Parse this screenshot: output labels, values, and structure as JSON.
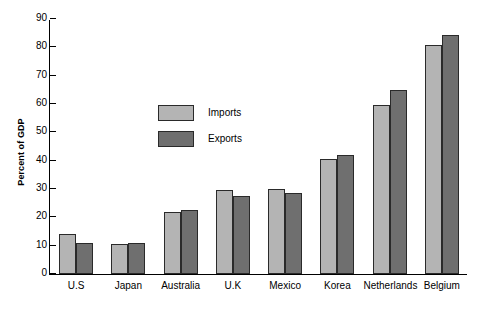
{
  "chart_data": {
    "type": "bar",
    "title": "",
    "subtitle": "",
    "xlabel": "",
    "ylabel": "Percent of GDP",
    "ylim": [
      0,
      90
    ],
    "yticks": [
      0,
      10,
      20,
      30,
      40,
      50,
      60,
      70,
      80,
      90
    ],
    "grid": false,
    "legend_position": "inside-upper-left",
    "categories": [
      "U.S",
      "Japan",
      "Australia",
      "U.K",
      "Mexico",
      "Korea",
      "Netherlands",
      "Belgium"
    ],
    "series": [
      {
        "name": "Imports",
        "color": "#b4b4b4",
        "values": [
          14,
          10.5,
          22,
          29.5,
          30,
          40.5,
          59.5,
          81
        ]
      },
      {
        "name": "Exports",
        "color": "#6f6f6f",
        "values": [
          11,
          11,
          22.5,
          27.5,
          28.5,
          42,
          65,
          84.5
        ]
      }
    ]
  },
  "axis": {
    "y_title": "Percent of GDP"
  },
  "legend": {
    "items": [
      {
        "label": "Imports",
        "color": "#b4b4b4"
      },
      {
        "label": "Exports",
        "color": "#6f6f6f"
      }
    ]
  },
  "style": {
    "background": "#ffffff",
    "axis_color": "#000000",
    "bar_border": "#2a2a2a"
  }
}
